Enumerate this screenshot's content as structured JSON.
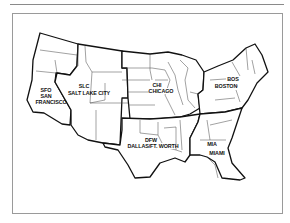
{
  "map": {
    "type": "regional-map",
    "subject": "Contiguous United States divided into six regions",
    "regions": [
      {
        "id": "west",
        "code": "SFO",
        "name_lines": [
          "SAN",
          "FRANCISCO"
        ],
        "name": "SAN FRANCISCO"
      },
      {
        "id": "mountain",
        "code": "SLC",
        "name_lines": [
          "SALT LAKE CITY"
        ],
        "name": "SALT LAKE CITY"
      },
      {
        "id": "central",
        "code": "CHI",
        "name_lines": [
          "CHICAGO"
        ],
        "name": "CHICAGO"
      },
      {
        "id": "northeast",
        "code": "BOS",
        "name_lines": [
          "BOSTON"
        ],
        "name": "BOSTON"
      },
      {
        "id": "south-central",
        "code": "DFW",
        "name_lines": [
          "DALLAS/FT. WORTH"
        ],
        "name": "DALLAS/FT. WORTH"
      },
      {
        "id": "southeast",
        "code": "MIA",
        "name_lines": [
          "MIAMI"
        ],
        "name": "MIAMI"
      }
    ],
    "colors": {
      "region_border": "#111111",
      "state_border": "#444444",
      "frame": "#9a9a9a",
      "background": "#ffffff"
    }
  }
}
